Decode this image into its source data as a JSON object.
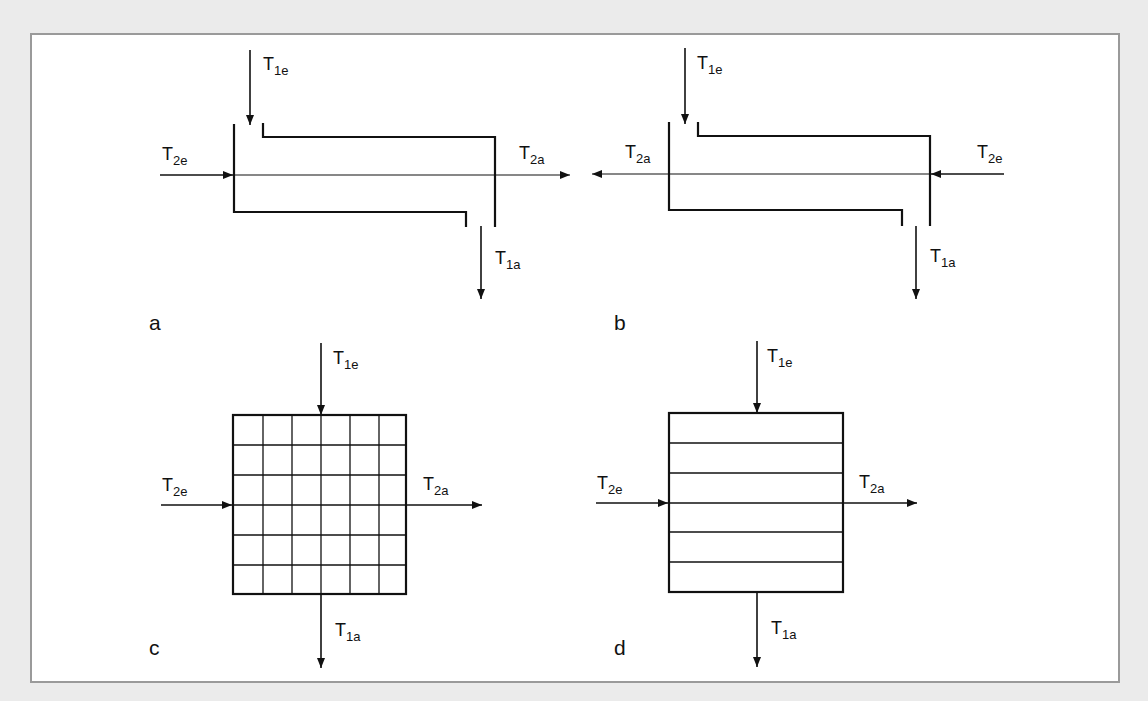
{
  "figure": {
    "background_color": "#ebebeb",
    "panel_border_color": "#9a9a9a",
    "line_color": "#111111"
  },
  "panels": {
    "a": {
      "letter": "a",
      "type": "parallel-flow tube heat exchanger",
      "labels": {
        "t1e": {
          "main": "T",
          "sub": "1e"
        },
        "t2e": {
          "main": "T",
          "sub": "2e"
        },
        "t2a": {
          "main": "T",
          "sub": "2a"
        },
        "t1a": {
          "main": "T",
          "sub": "1a"
        }
      }
    },
    "b": {
      "letter": "b",
      "type": "counter-flow tube heat exchanger",
      "labels": {
        "t1e": {
          "main": "T",
          "sub": "1e"
        },
        "t2a": {
          "main": "T",
          "sub": "2a"
        },
        "t2e": {
          "main": "T",
          "sub": "2e"
        },
        "t1a": {
          "main": "T",
          "sub": "1a"
        }
      }
    },
    "c": {
      "letter": "c",
      "type": "cross-flow, both streams unmixed (6x6 grid)",
      "grid_rows": 6,
      "grid_cols": 6,
      "labels": {
        "t1e": {
          "main": "T",
          "sub": "1e"
        },
        "t2e": {
          "main": "T",
          "sub": "2e"
        },
        "t2a": {
          "main": "T",
          "sub": "2a"
        },
        "t1a": {
          "main": "T",
          "sub": "1a"
        }
      }
    },
    "d": {
      "letter": "d",
      "type": "cross-flow, one stream mixed (6 channels)",
      "grid_rows": 6,
      "labels": {
        "t1e": {
          "main": "T",
          "sub": "1e"
        },
        "t2e": {
          "main": "T",
          "sub": "2e"
        },
        "t2a": {
          "main": "T",
          "sub": "2a"
        },
        "t1a": {
          "main": "T",
          "sub": "1a"
        }
      }
    }
  }
}
